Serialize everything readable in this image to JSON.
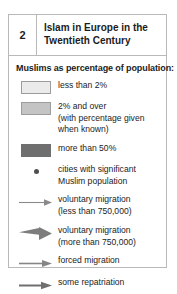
{
  "legend": {
    "header": {
      "number": "2",
      "title": "Islam in Europe in the Twentieth Century"
    },
    "section_title": "Muslims as percentage of population:",
    "colors": {
      "swatch_less_than_2": "#ebebeb",
      "swatch_2_and_over": "#c4c4c4",
      "swatch_more_than_50": "#6f6f6f",
      "city_dot": "#4f4f4f",
      "arrow": "#6f6f6f",
      "border": "#b9b9b9",
      "text": "#1c1c1c"
    },
    "entries": [
      {
        "key": "swatch-light",
        "icon_name": "swatch-less-than-2-percent",
        "lines": [
          "less than 2%"
        ]
      },
      {
        "key": "swatch-mid",
        "icon_name": "swatch-2-percent-and-over",
        "lines": [
          "2% and over",
          "(with percentage given",
          "when known)"
        ]
      },
      {
        "key": "swatch-dark",
        "icon_name": "swatch-more-than-50-percent",
        "lines": [
          "more than 50%"
        ]
      },
      {
        "key": "dot",
        "icon_name": "city-dot-icon",
        "lines": [
          "cities with significant",
          "Muslim population"
        ]
      },
      {
        "key": "arrow-thin",
        "icon_name": "voluntary-migration-small-arrow-icon",
        "lines": [
          "voluntary migration",
          "(less than 750,000)"
        ]
      },
      {
        "key": "arrow-wedge",
        "icon_name": "voluntary-migration-large-arrow-icon",
        "lines": [
          "voluntary migration",
          "(more than 750,000)"
        ]
      },
      {
        "key": "arrow-forced",
        "icon_name": "forced-migration-arrow-icon",
        "lines": [
          "forced migration"
        ]
      },
      {
        "key": "arrow-repatriation",
        "icon_name": "some-repatriation-arrow-icon",
        "lines": [
          "some repatriation"
        ]
      }
    ]
  }
}
